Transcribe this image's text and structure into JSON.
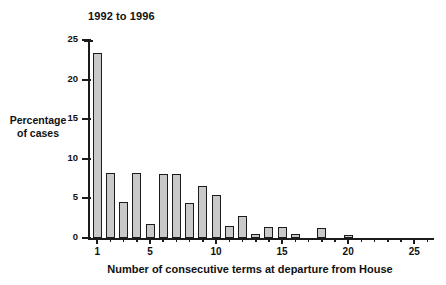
{
  "chart_data": {
    "type": "bar",
    "title": "1992 to 1996",
    "xlabel": "Number of consecutive terms at departure from House",
    "ylabel_line1": "Percentage",
    "ylabel_line2": "of cases",
    "categories": [
      1,
      2,
      3,
      4,
      5,
      6,
      7,
      8,
      9,
      10,
      11,
      12,
      13,
      14,
      15,
      16,
      17,
      18,
      19,
      20,
      21,
      22,
      23,
      24,
      25,
      26
    ],
    "values": [
      23.3,
      8.2,
      4.5,
      8.2,
      1.8,
      8.1,
      8.1,
      4.4,
      6.6,
      5.4,
      1.5,
      2.8,
      0.5,
      1.4,
      1.4,
      0.5,
      0,
      1.3,
      0,
      0.4,
      0,
      0,
      0,
      0,
      0,
      0
    ],
    "ylim": [
      0,
      25
    ],
    "xlim": [
      0.3,
      26.5
    ],
    "yticks": [
      0,
      5,
      10,
      15,
      20,
      25
    ],
    "ytick_labels": [
      "0",
      "5",
      "10",
      "15",
      "20",
      "25"
    ],
    "xticks": [
      1,
      2,
      3,
      4,
      5,
      6,
      7,
      8,
      9,
      10,
      11,
      12,
      13,
      14,
      15,
      16,
      17,
      18,
      19,
      20,
      21,
      22,
      23,
      24,
      25,
      26
    ],
    "xtick_labels_major": {
      "1": "1",
      "5": "5",
      "10": "10",
      "15": "15",
      "20": "20",
      "25": "25"
    },
    "grid": false,
    "legend": null,
    "bar_fill_color": "#c9c9c9",
    "bar_edge_color": "#1b1b1b",
    "axis_color": "#1b1b1b",
    "background_color": "#ffffff"
  }
}
